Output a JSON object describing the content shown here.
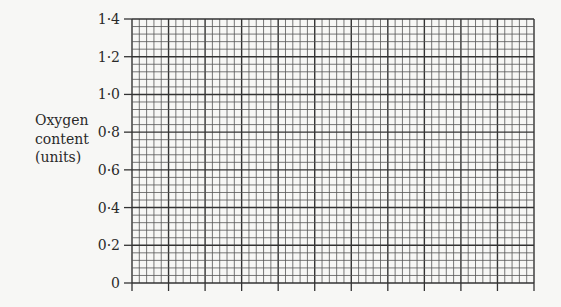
{
  "chart_data": {
    "type": "line",
    "title": "",
    "xlabel": "",
    "ylabel": "Oxygen content (units)",
    "ylabel_lines": [
      "Oxygen",
      "content",
      "(units)"
    ],
    "y_ticks": [
      "0",
      "0·2",
      "0·4",
      "0·6",
      "0·8",
      "1·0",
      "1·2",
      "1·4"
    ],
    "ylim": [
      0,
      1.4
    ],
    "x_tick_count": 12,
    "x_tick_labels": [],
    "grid": true,
    "series": []
  }
}
